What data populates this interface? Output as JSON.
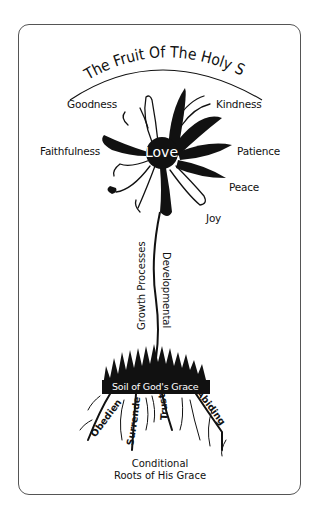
{
  "diagram": {
    "title": "The Fruit Of The Holy Spirit",
    "center_fruit": "Love",
    "fruits": [
      {
        "label": "Goodness",
        "x": 67,
        "y": 104
      },
      {
        "label": "Kindness",
        "x": 216,
        "y": 104
      },
      {
        "label": "Faithfulness",
        "x": 40,
        "y": 145
      },
      {
        "label": "Patience",
        "x": 237,
        "y": 145
      },
      {
        "label": "Peace",
        "x": 229,
        "y": 181
      },
      {
        "label": "Joy",
        "x": 206,
        "y": 212
      }
    ],
    "stem_labels": {
      "left": "Growth Processes",
      "right": "Developmental"
    },
    "soil_label": "Soil of God's Grace",
    "roots": [
      "Obedience",
      "Surrender",
      "Trust",
      "Abiding"
    ],
    "footer": {
      "line1": "Conditional",
      "line2": "Roots of His Grace"
    },
    "colors": {
      "ink": "#111111",
      "border": "#555555",
      "background": "#ffffff"
    }
  }
}
